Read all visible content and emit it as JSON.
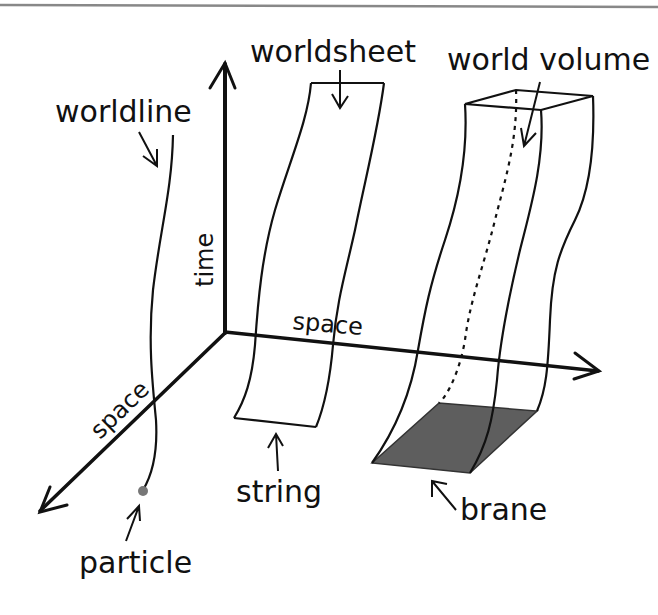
{
  "labels": {
    "worldline": "worldline",
    "worldsheet": "worldsheet",
    "world_volume": "world volume",
    "time_axis": "time",
    "space_axis_horizontal": "space",
    "space_axis_diagonal": "space",
    "particle": "particle",
    "string": "string",
    "brane": "brane"
  },
  "colors": {
    "line": "#111111",
    "brane_fill": "#5e5e5e",
    "particle_dot": "#777777",
    "top_rule": "#888888",
    "background": "#ffffff"
  }
}
